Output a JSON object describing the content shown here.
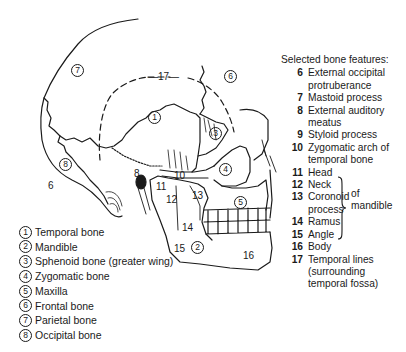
{
  "diagram": {
    "region_labels": [
      {
        "id": "1",
        "text": "1",
        "circled": true,
        "x": 178,
        "y": 114
      },
      {
        "id": "2",
        "text": "2",
        "circled": true,
        "x": 196,
        "y": 238
      },
      {
        "id": "3",
        "text": "3",
        "circled": true,
        "x": 213,
        "y": 129
      },
      {
        "id": "4",
        "text": "4",
        "circled": true,
        "x": 224,
        "y": 166
      },
      {
        "id": "5",
        "text": "5",
        "circled": true,
        "x": 240,
        "y": 202
      },
      {
        "id": "6",
        "text": "6",
        "circled": true,
        "x": 229,
        "y": 75
      },
      {
        "id": "7",
        "text": "7",
        "circled": true,
        "x": 76,
        "y": 69
      },
      {
        "id": "8",
        "text": "8",
        "circled": true,
        "x": 57,
        "y": 156
      }
    ],
    "feature_labels": [
      {
        "id": "f6",
        "text": "6",
        "x": 48,
        "y": 178
      },
      {
        "id": "f8",
        "text": "8",
        "x": 133,
        "y": 170
      },
      {
        "id": "f10",
        "text": "10",
        "x": 173,
        "y": 172
      },
      {
        "id": "f11",
        "text": "11",
        "x": 155,
        "y": 178
      },
      {
        "id": "f12",
        "text": "12",
        "x": 165,
        "y": 193
      },
      {
        "id": "f13",
        "text": "13",
        "x": 193,
        "y": 190
      },
      {
        "id": "f14",
        "text": "14",
        "x": 183,
        "y": 222
      },
      {
        "id": "f15",
        "text": "15",
        "x": 173,
        "y": 244
      },
      {
        "id": "f16",
        "text": "16",
        "x": 240,
        "y": 250
      },
      {
        "id": "f17",
        "text": "—17—",
        "x": 148,
        "y": 73
      }
    ]
  },
  "legend_bones": {
    "items": [
      {
        "num": "1",
        "label": "Temporal bone"
      },
      {
        "num": "2",
        "label": "Mandible"
      },
      {
        "num": "3",
        "label": "Sphenoid bone (greater wing)"
      },
      {
        "num": "4",
        "label": "Zygomatic bone"
      },
      {
        "num": "5",
        "label": "Maxilla"
      },
      {
        "num": "6",
        "label": "Frontal bone"
      },
      {
        "num": "7",
        "label": "Parietal bone"
      },
      {
        "num": "8",
        "label": "Occipital bone"
      }
    ]
  },
  "legend_features": {
    "title": "Selected bone features:",
    "items": [
      {
        "num": "6",
        "label": "External occipital protruberance"
      },
      {
        "num": "7",
        "label": "Mastoid process"
      },
      {
        "num": "8",
        "label": "External auditory meatus"
      },
      {
        "num": "9",
        "label": "Styloid process"
      },
      {
        "num": "10",
        "label": "Zygomatic arch of temporal bone"
      },
      {
        "num": "11",
        "label": "Head"
      },
      {
        "num": "12",
        "label": "Neck"
      },
      {
        "num": "13",
        "label": "Coronoid process"
      },
      {
        "num": "14",
        "label": "Ramus"
      },
      {
        "num": "15",
        "label": "Angle"
      },
      {
        "num": "16",
        "label": "Body"
      },
      {
        "num": "17",
        "label": "Temporal lines (surrounding temporal fossa)"
      }
    ],
    "group_note": "of mandible"
  }
}
